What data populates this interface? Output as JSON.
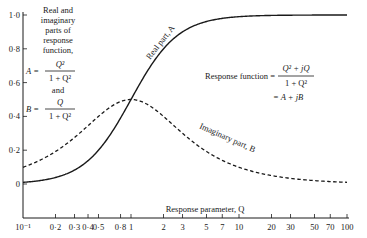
{
  "chart_data": {
    "type": "line",
    "title": "",
    "xlabel": "Response parameter, Q",
    "ylabel_lines": [
      "Real and",
      "imaginary",
      "parts of",
      "response",
      "function,"
    ],
    "xscale": "log",
    "xlim": [
      0.1,
      100
    ],
    "ylim": [
      0,
      1.0
    ],
    "grid": false,
    "x_ticks": [
      0.1,
      0.2,
      0.3,
      0.4,
      0.5,
      0.8,
      1,
      2,
      3,
      5,
      7,
      10,
      20,
      30,
      50,
      70,
      100
    ],
    "x_tick_labels": [
      "10⁻¹",
      "0·2",
      "0·3",
      "0·4",
      "0·5",
      "0·8",
      "1",
      "2",
      "3",
      "5",
      "7",
      "10",
      "20",
      "30",
      "50",
      "70",
      "100"
    ],
    "y_ticks": [
      0,
      0.2,
      0.4,
      0.6,
      0.8,
      1.0
    ],
    "y_tick_labels": [
      "0",
      "0·2",
      "0·4",
      "0·6",
      "0·8",
      "1·0"
    ],
    "series": [
      {
        "name": "Real part, A",
        "formula": "A = Q² / (1 + Q²)",
        "style": "solid"
      },
      {
        "name": "Imaginary part, B",
        "formula": "B = Q / (1 + Q²)",
        "style": "dashed"
      }
    ],
    "annotations": {
      "real_label": "Real part, A",
      "imag_label": "Imaginary part, B",
      "A_def": {
        "lhs": "A =",
        "num": "Q²",
        "den": "1 + Q²"
      },
      "and": "and",
      "B_def": {
        "lhs": "B =",
        "num": "Q",
        "den": "1 + Q²"
      },
      "response_fn": {
        "lhs": "Response function =",
        "num": "Q² + jQ",
        "den": "1 + Q²",
        "line2": "= A + jB"
      }
    }
  }
}
